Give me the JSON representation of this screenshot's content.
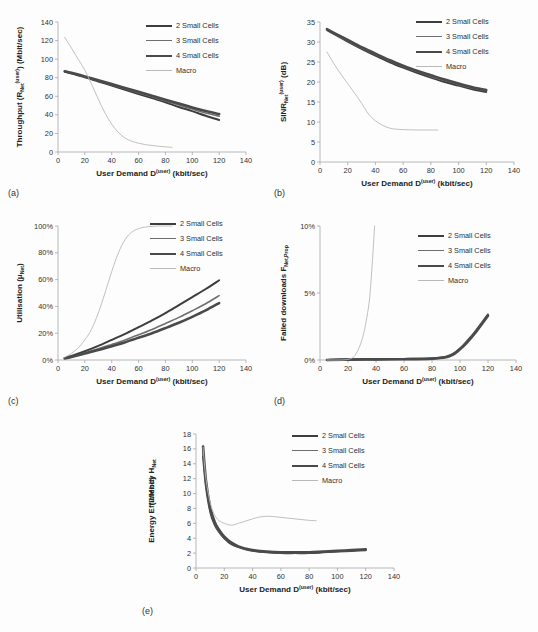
{
  "figure": {
    "background": "#fdfdfd",
    "legend_labels": [
      "2 Small Cells",
      "3 Small Cells",
      "4 Small Cells",
      "Macro"
    ],
    "series_colors": [
      "#3d3d3d",
      "#6e6e6e",
      "#4a4a4a",
      "#b9b9b9"
    ],
    "series_widths": [
      2.0,
      1.6,
      2.6,
      0.9
    ],
    "xlabel_main": "User Demand D",
    "xlabel_sup": "(user)",
    "xlabel_unit": " (kbit/sec)",
    "panel_labels": [
      "(a)",
      "(b)",
      "(c)",
      "(d)",
      "(e)"
    ]
  },
  "chart_data": [
    {
      "id": "a",
      "type": "line",
      "panel_label": "(a)",
      "title": "",
      "xlabel": "User Demand D(user) (kbit/sec)",
      "ylabel": "Throughput (RNet(user)) (Mbit/sec)",
      "ylabel_parts": {
        "pre": "Throughput (R",
        "sub": "Net",
        "sup": "(user)",
        "post": ") (Mbit/sec)"
      },
      "xlim": [
        0,
        140
      ],
      "ylim": [
        0,
        140
      ],
      "xticks": [
        0,
        20,
        40,
        60,
        80,
        100,
        120,
        140
      ],
      "yticks": [
        0,
        20,
        40,
        60,
        80,
        100,
        120,
        140
      ],
      "ytick_labels": [
        "0",
        "20",
        "40",
        "60",
        "80",
        "100",
        "120",
        "140"
      ],
      "grid": false,
      "legend_position": "top-right",
      "series": [
        {
          "name": "2 Small Cells",
          "x": [
            5,
            10,
            20,
            30,
            40,
            50,
            60,
            70,
            80,
            90,
            100,
            110,
            120
          ],
          "values": [
            86.5,
            84.5,
            80.5,
            76.0,
            71.5,
            67.0,
            62.5,
            58.0,
            53.5,
            48.5,
            44.0,
            39.0,
            34.5
          ]
        },
        {
          "name": "3 Small Cells",
          "x": [
            5,
            10,
            20,
            30,
            40,
            50,
            60,
            70,
            80,
            90,
            100,
            110,
            120
          ],
          "values": [
            86.8,
            85.0,
            81.0,
            76.8,
            72.5,
            68.2,
            63.8,
            59.4,
            55.0,
            50.6,
            46.2,
            42.0,
            38.5
          ]
        },
        {
          "name": "4 Small Cells",
          "x": [
            5,
            10,
            20,
            30,
            40,
            50,
            60,
            70,
            80,
            90,
            100,
            110,
            120
          ],
          "values": [
            87.0,
            85.3,
            81.4,
            77.3,
            73.2,
            69.0,
            64.8,
            60.6,
            56.4,
            52.2,
            48.0,
            44.2,
            40.8
          ]
        },
        {
          "name": "Macro",
          "x": [
            5,
            10,
            15,
            20,
            25,
            30,
            35,
            40,
            45,
            50,
            55,
            60,
            65,
            70,
            75,
            80,
            85
          ],
          "values": [
            123.5,
            112.0,
            100.0,
            88.0,
            73.0,
            57.0,
            42.0,
            30.0,
            21.0,
            15.0,
            11.5,
            9.5,
            8.0,
            7.0,
            6.2,
            5.5,
            5.0
          ]
        }
      ]
    },
    {
      "id": "b",
      "type": "line",
      "panel_label": "(b)",
      "title": "",
      "xlabel": "User Demand D(user) (kbit/sec)",
      "ylabel": "SINRNet(user) (dB)",
      "ylabel_parts": {
        "pre": "SINR",
        "sub": "Net",
        "sup": "(user)",
        "post": " (dB)"
      },
      "xlim": [
        0,
        140
      ],
      "ylim": [
        0,
        35
      ],
      "xticks": [
        0,
        20,
        40,
        60,
        80,
        100,
        120,
        140
      ],
      "yticks": [
        0,
        5,
        10,
        15,
        20,
        25,
        30,
        35
      ],
      "ytick_labels": [
        "0",
        "5",
        "10",
        "15",
        "20",
        "25",
        "30",
        "35"
      ],
      "grid": false,
      "legend_position": "top-right",
      "series": [
        {
          "name": "2 Small Cells",
          "x": [
            5,
            10,
            20,
            30,
            40,
            50,
            60,
            70,
            80,
            90,
            100,
            110,
            120
          ],
          "values": [
            33.0,
            32.0,
            30.1,
            28.3,
            26.6,
            25.0,
            23.6,
            22.3,
            21.1,
            20.0,
            19.1,
            18.2,
            17.5
          ]
        },
        {
          "name": "3 Small Cells",
          "x": [
            5,
            10,
            20,
            30,
            40,
            50,
            60,
            70,
            80,
            90,
            100,
            110,
            120
          ],
          "values": [
            33.1,
            32.2,
            30.3,
            28.5,
            26.9,
            25.3,
            23.9,
            22.6,
            21.4,
            20.4,
            19.4,
            18.5,
            17.8
          ]
        },
        {
          "name": "4 Small Cells",
          "x": [
            5,
            10,
            20,
            30,
            40,
            50,
            60,
            70,
            80,
            90,
            100,
            110,
            120
          ],
          "values": [
            33.2,
            32.3,
            30.5,
            28.7,
            27.1,
            25.5,
            24.1,
            22.8,
            21.7,
            20.6,
            19.6,
            18.7,
            18.0
          ]
        },
        {
          "name": "Macro",
          "x": [
            5,
            10,
            15,
            20,
            25,
            30,
            35,
            40,
            45,
            50,
            55,
            60,
            70,
            80,
            85
          ],
          "values": [
            27.5,
            24.6,
            22.0,
            19.6,
            17.2,
            14.7,
            12.0,
            10.3,
            9.2,
            8.5,
            8.2,
            8.1,
            8.0,
            8.0,
            8.0
          ]
        }
      ]
    },
    {
      "id": "c",
      "type": "line",
      "panel_label": "(c)",
      "title": "",
      "xlabel": "User Demand D(user) (kbit/sec)",
      "ylabel": "Utilisation (μNet)",
      "ylabel_parts": {
        "pre": "Utilisation (μ",
        "sub": "Net",
        "sup": "",
        "post": ")"
      },
      "xlim": [
        0,
        140
      ],
      "ylim": [
        0,
        100
      ],
      "xticks": [
        0,
        20,
        40,
        60,
        80,
        100,
        120,
        140
      ],
      "yticks": [
        0,
        20,
        40,
        60,
        80,
        100
      ],
      "ytick_labels": [
        "0%",
        "20%",
        "40%",
        "60%",
        "80%",
        "100%"
      ],
      "grid": false,
      "legend_position": "top-right",
      "series": [
        {
          "name": "2 Small Cells",
          "x": [
            5,
            10,
            20,
            30,
            40,
            50,
            60,
            70,
            80,
            90,
            100,
            110,
            120
          ],
          "values": [
            1.5,
            3.0,
            6.5,
            10.5,
            15.0,
            19.5,
            24.5,
            29.5,
            35.0,
            41.0,
            47.0,
            53.0,
            59.5
          ]
        },
        {
          "name": "3 Small Cells",
          "x": [
            5,
            10,
            20,
            30,
            40,
            50,
            60,
            70,
            80,
            90,
            100,
            110,
            120
          ],
          "values": [
            1.3,
            2.5,
            5.3,
            8.3,
            11.6,
            15.0,
            18.8,
            22.8,
            27.2,
            31.8,
            36.8,
            42.0,
            48.0
          ]
        },
        {
          "name": "4 Small Cells",
          "x": [
            5,
            10,
            20,
            30,
            40,
            50,
            60,
            70,
            80,
            90,
            100,
            110,
            120
          ],
          "values": [
            1.2,
            2.3,
            4.8,
            7.4,
            10.3,
            13.3,
            16.6,
            20.0,
            23.8,
            27.8,
            32.2,
            37.0,
            42.5
          ]
        },
        {
          "name": "Macro",
          "x": [
            5,
            10,
            15,
            20,
            25,
            30,
            35,
            40,
            45,
            50,
            55,
            60,
            65,
            70,
            75,
            80,
            85
          ],
          "values": [
            2.0,
            5.0,
            9.0,
            15.0,
            23.0,
            35.0,
            50.0,
            66.0,
            80.0,
            90.0,
            95.5,
            98.0,
            99.2,
            99.7,
            100.0,
            100.0,
            100.0
          ]
        }
      ]
    },
    {
      "id": "d",
      "type": "line",
      "panel_label": "(d)",
      "title": "",
      "xlabel": "User Demand D(user) (kbit/sec)",
      "ylabel": "Failed downloads FNet,Prop",
      "ylabel_parts": {
        "pre": "Failed downloads F",
        "sub": "Net,Prop",
        "sup": "",
        "post": ""
      },
      "xlim": [
        0,
        140
      ],
      "ylim": [
        0,
        10
      ],
      "xticks": [
        0,
        20,
        40,
        60,
        80,
        100,
        120,
        140
      ],
      "yticks": [
        0,
        5,
        10
      ],
      "ytick_labels": [
        "0%",
        "5%",
        "10%"
      ],
      "grid": false,
      "legend_position": "top-right",
      "series": [
        {
          "name": "2 Small Cells",
          "x": [
            5,
            20,
            40,
            60,
            80,
            90,
            95,
            100,
            105,
            110,
            115,
            120
          ],
          "values": [
            0.0,
            0.05,
            0.05,
            0.08,
            0.12,
            0.25,
            0.45,
            0.85,
            1.4,
            2.0,
            2.7,
            3.4
          ]
        },
        {
          "name": "3 Small Cells",
          "x": [
            5,
            20,
            40,
            60,
            80,
            90,
            95,
            100,
            105,
            110,
            115,
            120
          ],
          "values": [
            0.0,
            0.04,
            0.05,
            0.07,
            0.11,
            0.22,
            0.42,
            0.82,
            1.35,
            1.95,
            2.65,
            3.35
          ]
        },
        {
          "name": "4 Small Cells",
          "x": [
            5,
            20,
            40,
            60,
            80,
            90,
            95,
            100,
            105,
            110,
            115,
            120
          ],
          "values": [
            0.0,
            0.03,
            0.05,
            0.06,
            0.1,
            0.2,
            0.4,
            0.8,
            1.3,
            1.9,
            2.6,
            3.3
          ]
        },
        {
          "name": "Macro",
          "x": [
            5,
            15,
            20,
            23,
            25,
            27,
            29,
            31,
            33,
            35,
            36,
            37,
            38,
            39
          ],
          "values": [
            0.0,
            0.0,
            0.05,
            0.15,
            0.35,
            0.7,
            1.2,
            1.9,
            2.9,
            4.2,
            5.3,
            6.7,
            8.3,
            10.0
          ]
        }
      ]
    },
    {
      "id": "e",
      "type": "line",
      "panel_label": "(e)",
      "title": "",
      "xlabel": "User Demand D(user) (kbit/sec)",
      "ylabel": "Energy Efficiency HNet (J/Mbit)",
      "ylabel_parts": {
        "pre": "Energy Efficiency H",
        "sub": "Net",
        "sup": "",
        "post": ""
      },
      "ylabel_line2": "(J/Mbit)",
      "xlim": [
        0,
        140
      ],
      "ylim": [
        0,
        18
      ],
      "xticks": [
        0,
        20,
        40,
        60,
        80,
        100,
        120,
        140
      ],
      "yticks": [
        0,
        2,
        4,
        6,
        8,
        10,
        12,
        14,
        16,
        18
      ],
      "ytick_labels": [
        "0",
        "2",
        "4",
        "6",
        "8",
        "10",
        "12",
        "14",
        "16",
        "18"
      ],
      "grid": false,
      "legend_position": "top-right",
      "series": [
        {
          "name": "2 Small Cells",
          "x": [
            5,
            7,
            10,
            13,
            16,
            20,
            25,
            30,
            35,
            40,
            50,
            60,
            70,
            80,
            90,
            100,
            110,
            120
          ],
          "values": [
            15.0,
            11.0,
            7.6,
            5.9,
            4.9,
            4.0,
            3.2,
            2.8,
            2.5,
            2.3,
            2.1,
            2.0,
            2.0,
            2.0,
            2.1,
            2.2,
            2.3,
            2.4
          ]
        },
        {
          "name": "3 Small Cells",
          "x": [
            5,
            7,
            10,
            13,
            16,
            20,
            25,
            30,
            35,
            40,
            50,
            60,
            70,
            80,
            90,
            100,
            110,
            120
          ],
          "values": [
            15.6,
            11.4,
            7.9,
            6.1,
            5.0,
            4.1,
            3.3,
            2.85,
            2.55,
            2.35,
            2.15,
            2.05,
            2.05,
            2.05,
            2.15,
            2.25,
            2.35,
            2.45
          ]
        },
        {
          "name": "4 Small Cells",
          "x": [
            5,
            7,
            10,
            13,
            16,
            20,
            25,
            30,
            35,
            40,
            50,
            60,
            70,
            80,
            90,
            100,
            110,
            120
          ],
          "values": [
            16.3,
            11.8,
            8.2,
            6.3,
            5.2,
            4.2,
            3.4,
            2.9,
            2.6,
            2.4,
            2.2,
            2.1,
            2.1,
            2.1,
            2.2,
            2.3,
            2.4,
            2.5
          ]
        },
        {
          "name": "Macro",
          "x": [
            5,
            7,
            10,
            13,
            16,
            20,
            25,
            30,
            35,
            40,
            45,
            50,
            55,
            60,
            65,
            70,
            75,
            80,
            85
          ],
          "values": [
            16.2,
            12.0,
            8.8,
            7.2,
            6.4,
            6.0,
            5.75,
            6.0,
            6.3,
            6.6,
            6.85,
            6.95,
            6.9,
            6.8,
            6.7,
            6.6,
            6.5,
            6.4,
            6.35
          ]
        }
      ]
    }
  ]
}
